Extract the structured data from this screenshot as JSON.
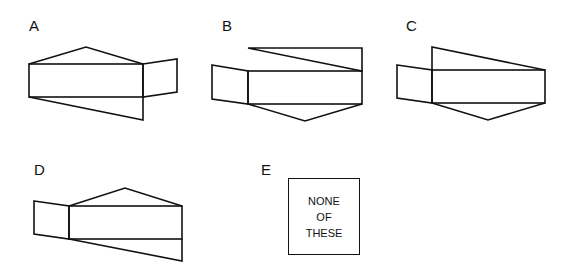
{
  "options": [
    {
      "label": "A"
    },
    {
      "label": "B"
    },
    {
      "label": "C"
    },
    {
      "label": "D"
    },
    {
      "label": "E",
      "text_lines": [
        "NONE",
        "OF",
        "THESE"
      ]
    }
  ],
  "colors": {
    "stroke": "#111111",
    "background": "#ffffff"
  }
}
